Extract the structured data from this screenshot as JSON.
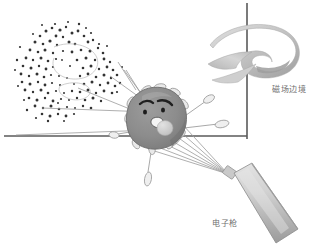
{
  "diagram": {
    "background_color": "#ffffff",
    "labels": {
      "magnetic_field_boundary": "磁场边境",
      "electron_gun": "电子枪"
    },
    "colors": {
      "axis_line": "#5a5a5a",
      "cell_body": "#8f8f8f",
      "cell_body_dark": "#7b7b7b",
      "cell_outline": "#6d6d6d",
      "ribbon_light": "#d4d4d4",
      "ribbon_dark": "#9a9a9a",
      "gun_light": "#d8d8d8",
      "gun_dark": "#a2a2a2",
      "beam_line": "#9b9b9b",
      "particle": "#3a3a3a",
      "label_text": "#6f6f6f",
      "cilia_fill": "#eaeaea",
      "cilia_stroke": "#8d8d8d",
      "vacuole": "#cfcfcf",
      "face_dark": "#262626"
    },
    "axes": {
      "vertical": {
        "x": 247,
        "y1": 3,
        "y2": 139
      },
      "horizontal": {
        "y": 136,
        "x1": 4,
        "x2": 247
      }
    },
    "magnetic_ribbon": {
      "description": "curved hook shaped ribbon crossing the vertical axis",
      "center_x": 250,
      "center_y": 55
    },
    "electron_gun": {
      "nozzle": {
        "x": 228,
        "y": 172
      },
      "body_center": {
        "x": 263,
        "y": 196
      },
      "angle_deg": 35
    },
    "cell": {
      "center_x": 157,
      "center_y": 120,
      "radius_x": 30,
      "radius_y": 28,
      "expression": "angry",
      "features": [
        "eyebrows",
        "eyes",
        "open-mouth",
        "vacuole",
        "cilia",
        "flagella"
      ]
    },
    "particle_cloud": {
      "count": 230,
      "center_x": 62,
      "center_y": 72,
      "spread_x": 42,
      "spread_y": 38,
      "note": "ring shaped scatter of ejected particles"
    },
    "beams": {
      "count_from_gun": 7,
      "count_to_cloud": 4
    }
  }
}
